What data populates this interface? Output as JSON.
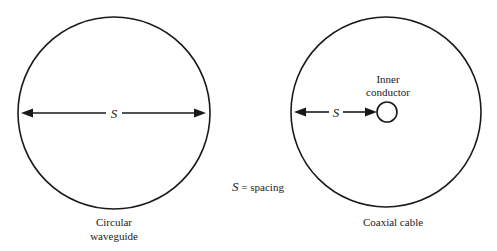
{
  "diagram": {
    "waveguide": {
      "label_line1": "Circular",
      "label_line2": "waveguide",
      "dimension_symbol": "S"
    },
    "coax": {
      "label": "Coaxial cable",
      "inner_label_line1": "Inner",
      "inner_label_line2": "conductor",
      "dimension_symbol": "S"
    },
    "legend": {
      "symbol": "S",
      "text": " = spacing"
    }
  }
}
